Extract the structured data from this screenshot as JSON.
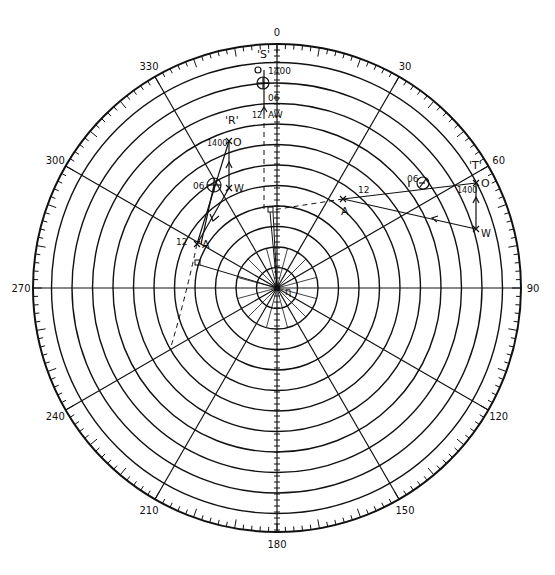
{
  "diagram": {
    "title": "",
    "type": "maneuvering board (polar plot)",
    "center": [
      277,
      288
    ],
    "outer_radius": 244,
    "ring_count": 11,
    "ring_spacing": 20.5,
    "radial_step_deg": 30,
    "bearing_labels": [
      {
        "deg": 0,
        "text": "0"
      },
      {
        "deg": 30,
        "text": "30"
      },
      {
        "deg": 60,
        "text": "60"
      },
      {
        "deg": 90,
        "text": "90"
      },
      {
        "deg": 120,
        "text": "120"
      },
      {
        "deg": 150,
        "text": "150"
      },
      {
        "deg": 180,
        "text": "180"
      },
      {
        "deg": 210,
        "text": "210"
      },
      {
        "deg": 240,
        "text": "240"
      },
      {
        "deg": 270,
        "text": "270"
      },
      {
        "deg": 300,
        "text": "300"
      },
      {
        "deg": 330,
        "text": "330"
      }
    ],
    "center_label": "η",
    "ships": [
      {
        "name": "'S'",
        "points": {
          "O": [
            264,
            70
          ],
          "fix06": [
            263,
            83
          ],
          "x06": [
            264,
            97
          ],
          "AW": [
            264,
            114
          ]
        },
        "labels": {
          "name": "'S'",
          "time_start": "1400",
          "time_mid": "06",
          "time_end": "12",
          "end": "AW",
          "origin": "O"
        }
      },
      {
        "name": "'R'",
        "points": {
          "O": [
            229,
            141
          ],
          "fix06": [
            214,
            185
          ],
          "W": [
            229,
            188
          ],
          "A": [
            197,
            244
          ]
        },
        "labels": {
          "name": "'R'",
          "time_start": "1400",
          "time_mid": "06",
          "time_end": "12",
          "origin": "O",
          "wind": "W",
          "apparent": "A"
        }
      },
      {
        "name": "'T'",
        "points": {
          "O": [
            476,
            183
          ],
          "fix06": [
            423,
            183
          ],
          "W": [
            476,
            229
          ],
          "A": [
            343,
            199
          ]
        },
        "labels": {
          "name": "'T'",
          "time_start": "1400",
          "time_mid": "06",
          "time_end": "12",
          "origin": "O",
          "wind": "W",
          "apparent": "A"
        }
      }
    ]
  }
}
